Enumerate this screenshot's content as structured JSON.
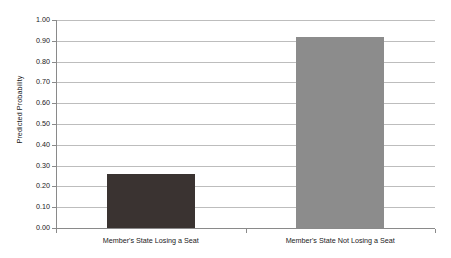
{
  "chart_data": {
    "type": "bar",
    "title": "",
    "subtitle": "",
    "xlabel": "",
    "ylabel": "Predicted Probability",
    "categories": [
      "Member's State Losing a Seat",
      "Member's State Not Losing a Seat"
    ],
    "values": [
      0.26,
      0.92
    ],
    "bar_colors": [
      "#3a3331",
      "#8c8c8c"
    ],
    "ylim": [
      0.0,
      1.0
    ],
    "ytick_step": 0.1,
    "ytick_labels": [
      "0.00",
      "0.10",
      "0.20",
      "0.30",
      "0.40",
      "0.50",
      "0.60",
      "0.70",
      "0.80",
      "0.90",
      "1.00"
    ],
    "ytick_values": [
      0.0,
      0.1,
      0.2,
      0.3,
      0.4,
      0.5,
      0.6,
      0.7,
      0.8,
      0.9,
      1.0
    ],
    "grid": true,
    "grid_axis": "y",
    "legend": false,
    "legend_position": "none",
    "background_color": "#ffffff",
    "gridline_color": "#bdbdbd",
    "axis_color": "#8a8a8a",
    "text_color": "#1a1a1a"
  }
}
